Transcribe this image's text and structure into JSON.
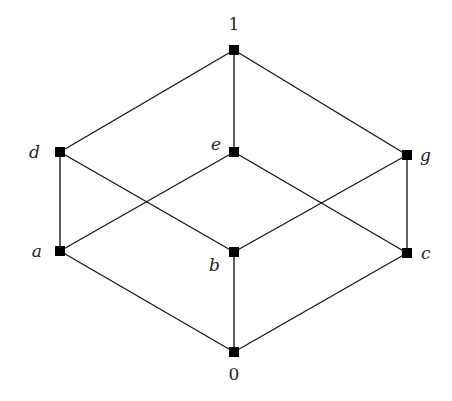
{
  "diagram": {
    "type": "hasse-diagram",
    "nodes": [
      {
        "id": "1",
        "label": "1",
        "x": 234,
        "y": 50,
        "label_x": 234,
        "label_y": 30,
        "italic": false,
        "anchor": "middle"
      },
      {
        "id": "d",
        "label": "d",
        "x": 60,
        "y": 152,
        "label_x": 40,
        "label_y": 158,
        "italic": true,
        "anchor": "end"
      },
      {
        "id": "e",
        "label": "e",
        "x": 234,
        "y": 152,
        "label_x": 221,
        "label_y": 150,
        "italic": true,
        "anchor": "end"
      },
      {
        "id": "g",
        "label": "g",
        "x": 407,
        "y": 155,
        "label_x": 420,
        "label_y": 161,
        "italic": true,
        "anchor": "start"
      },
      {
        "id": "a",
        "label": "a",
        "x": 60,
        "y": 251,
        "label_x": 42,
        "label_y": 257,
        "italic": true,
        "anchor": "end"
      },
      {
        "id": "b",
        "label": "b",
        "x": 234,
        "y": 252,
        "label_x": 220,
        "label_y": 271,
        "italic": true,
        "anchor": "end"
      },
      {
        "id": "c",
        "label": "c",
        "x": 407,
        "y": 253,
        "label_x": 421,
        "label_y": 259,
        "italic": true,
        "anchor": "start"
      },
      {
        "id": "0",
        "label": "0",
        "x": 234,
        "y": 352,
        "label_x": 234,
        "label_y": 380,
        "italic": false,
        "anchor": "middle"
      }
    ],
    "edges": [
      [
        "1",
        "d"
      ],
      [
        "1",
        "e"
      ],
      [
        "1",
        "g"
      ],
      [
        "d",
        "a"
      ],
      [
        "d",
        "b"
      ],
      [
        "e",
        "a"
      ],
      [
        "e",
        "c"
      ],
      [
        "g",
        "b"
      ],
      [
        "g",
        "c"
      ],
      [
        "a",
        "0"
      ],
      [
        "b",
        "0"
      ],
      [
        "c",
        "0"
      ]
    ],
    "node_size": 10,
    "colors": {
      "background": "#ffffff",
      "node": "#000000",
      "edge": "#1a1a1a",
      "label": "#222222"
    }
  }
}
